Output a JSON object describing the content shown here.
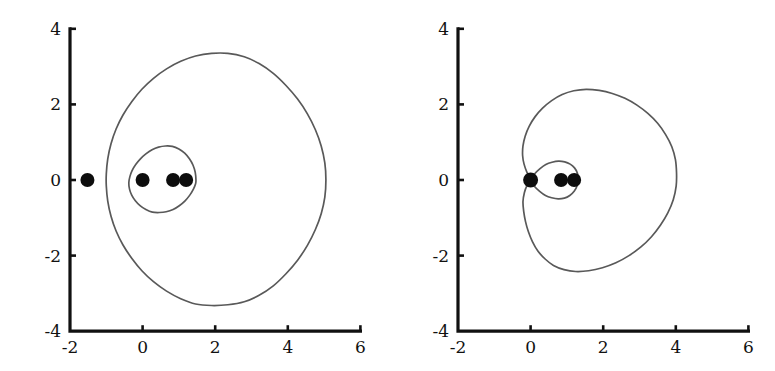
{
  "figure": {
    "background_color": "#ffffff",
    "curve_color": "#595959",
    "axis_color": "#111111",
    "marker_color": "#0d0d0d",
    "panel_count": 2
  },
  "chart_data": [
    {
      "type": "line",
      "panel": "left",
      "title": "",
      "subtitle": "",
      "xlabel": "",
      "ylabel": "",
      "xlim": [
        -2,
        6
      ],
      "ylim": [
        -4,
        4
      ],
      "xticks": [
        -2,
        0,
        2,
        4,
        6
      ],
      "xtick_labels": [
        "-2",
        "0",
        "2",
        "4",
        "6"
      ],
      "yticks": [
        -4,
        -2,
        0,
        2,
        4
      ],
      "ytick_labels": [
        "-4",
        "-2",
        "0",
        "2",
        "4"
      ],
      "grid": false,
      "legend": "none",
      "annotations": [],
      "series": [
        {
          "name": "outer-level-curve",
          "closed": true,
          "comment": "large oval lemniscate level set",
          "x_extent": [
            -1.0,
            5.05
          ],
          "y_extent": [
            -3.3,
            3.35
          ],
          "points_xy": [
            [
              5.05,
              0.0
            ],
            [
              5.02,
              0.45
            ],
            [
              4.92,
              0.9
            ],
            [
              4.76,
              1.33
            ],
            [
              4.54,
              1.75
            ],
            [
              4.27,
              2.14
            ],
            [
              3.95,
              2.5
            ],
            [
              3.6,
              2.82
            ],
            [
              3.21,
              3.08
            ],
            [
              2.8,
              3.26
            ],
            [
              2.35,
              3.35
            ],
            [
              1.9,
              3.35
            ],
            [
              1.46,
              3.28
            ],
            [
              1.05,
              3.14
            ],
            [
              0.66,
              2.94
            ],
            [
              0.3,
              2.69
            ],
            [
              -0.02,
              2.4
            ],
            [
              -0.3,
              2.07
            ],
            [
              -0.54,
              1.72
            ],
            [
              -0.73,
              1.35
            ],
            [
              -0.87,
              0.96
            ],
            [
              -0.96,
              0.56
            ],
            [
              -1.0,
              0.16
            ],
            [
              -1.0,
              -0.16
            ],
            [
              -0.96,
              -0.56
            ],
            [
              -0.87,
              -0.96
            ],
            [
              -0.73,
              -1.35
            ],
            [
              -0.54,
              -1.72
            ],
            [
              -0.3,
              -2.07
            ],
            [
              -0.02,
              -2.4
            ],
            [
              0.3,
              -2.69
            ],
            [
              0.66,
              -2.94
            ],
            [
              1.05,
              -3.14
            ],
            [
              1.46,
              -3.28
            ],
            [
              1.9,
              -3.32
            ],
            [
              2.35,
              -3.3
            ],
            [
              2.8,
              -3.22
            ],
            [
              3.21,
              -3.05
            ],
            [
              3.6,
              -2.8
            ],
            [
              3.95,
              -2.48
            ],
            [
              4.27,
              -2.12
            ],
            [
              4.54,
              -1.73
            ],
            [
              4.76,
              -1.31
            ],
            [
              4.92,
              -0.89
            ],
            [
              5.02,
              -0.45
            ],
            [
              5.05,
              0.0
            ]
          ]
        },
        {
          "name": "inner-level-curve",
          "closed": true,
          "comment": "small oval around the three roots",
          "x_extent": [
            -0.38,
            1.47
          ],
          "y_extent": [
            -0.86,
            0.9
          ],
          "points_xy": [
            [
              1.47,
              0.0
            ],
            [
              1.45,
              0.2
            ],
            [
              1.39,
              0.39
            ],
            [
              1.29,
              0.56
            ],
            [
              1.16,
              0.71
            ],
            [
              1.0,
              0.82
            ],
            [
              0.82,
              0.89
            ],
            [
              0.63,
              0.9
            ],
            [
              0.44,
              0.87
            ],
            [
              0.26,
              0.8
            ],
            [
              0.09,
              0.69
            ],
            [
              -0.06,
              0.56
            ],
            [
              -0.19,
              0.41
            ],
            [
              -0.29,
              0.25
            ],
            [
              -0.35,
              0.09
            ],
            [
              -0.38,
              -0.07
            ],
            [
              -0.36,
              -0.24
            ],
            [
              -0.3,
              -0.4
            ],
            [
              -0.2,
              -0.55
            ],
            [
              -0.07,
              -0.68
            ],
            [
              0.09,
              -0.78
            ],
            [
              0.27,
              -0.85
            ],
            [
              0.46,
              -0.86
            ],
            [
              0.65,
              -0.84
            ],
            [
              0.84,
              -0.78
            ],
            [
              1.01,
              -0.68
            ],
            [
              1.17,
              -0.55
            ],
            [
              1.3,
              -0.4
            ],
            [
              1.4,
              -0.24
            ],
            [
              1.46,
              -0.1
            ],
            [
              1.47,
              0.0
            ]
          ]
        }
      ],
      "markers": [
        {
          "name": "marker-dot-a",
          "x": -1.52,
          "y": 0.0,
          "r_px": 7.0
        },
        {
          "name": "marker-dot-b",
          "x": 0.0,
          "y": 0.0,
          "r_px": 7.0
        },
        {
          "name": "marker-dot-c",
          "x": 0.84,
          "y": 0.0,
          "r_px": 7.0
        },
        {
          "name": "marker-dot-d",
          "x": 1.2,
          "y": 0.0,
          "r_px": 7.0
        }
      ]
    },
    {
      "type": "line",
      "panel": "right",
      "title": "",
      "subtitle": "",
      "xlabel": "",
      "ylabel": "",
      "xlim": [
        -2,
        6
      ],
      "ylim": [
        -4,
        4
      ],
      "xticks": [
        -2,
        0,
        2,
        4,
        6
      ],
      "xtick_labels": [
        "-2",
        "0",
        "2",
        "4",
        "6"
      ],
      "yticks": [
        -4,
        -2,
        0,
        2,
        4
      ],
      "ytick_labels": [
        "-4",
        "-2",
        "0",
        "2",
        "4"
      ],
      "grid": false,
      "legend": "none",
      "annotations": [],
      "series": [
        {
          "name": "outer-lemniscate-lobe",
          "closed": true,
          "comment": "large lobe of the figure-eight level curve, pinched at the origin",
          "x_extent": [
            -0.22,
            4.02
          ],
          "y_extent": [
            -2.42,
            2.4
          ],
          "points_xy": [
            [
              0.0,
              0.0
            ],
            [
              -0.1,
              0.2
            ],
            [
              -0.18,
              0.42
            ],
            [
              -0.22,
              0.65
            ],
            [
              -0.21,
              0.9
            ],
            [
              -0.15,
              1.16
            ],
            [
              -0.04,
              1.42
            ],
            [
              0.12,
              1.67
            ],
            [
              0.33,
              1.9
            ],
            [
              0.58,
              2.1
            ],
            [
              0.87,
              2.26
            ],
            [
              1.19,
              2.36
            ],
            [
              1.53,
              2.4
            ],
            [
              1.89,
              2.37
            ],
            [
              2.25,
              2.29
            ],
            [
              2.6,
              2.16
            ],
            [
              2.93,
              1.98
            ],
            [
              3.23,
              1.76
            ],
            [
              3.5,
              1.5
            ],
            [
              3.72,
              1.2
            ],
            [
              3.89,
              0.88
            ],
            [
              3.99,
              0.54
            ],
            [
              4.02,
              0.19
            ],
            [
              4.01,
              -0.16
            ],
            [
              3.93,
              -0.52
            ],
            [
              3.78,
              -0.87
            ],
            [
              3.58,
              -1.19
            ],
            [
              3.33,
              -1.5
            ],
            [
              3.04,
              -1.77
            ],
            [
              2.71,
              -2.0
            ],
            [
              2.35,
              -2.19
            ],
            [
              1.98,
              -2.32
            ],
            [
              1.6,
              -2.4
            ],
            [
              1.24,
              -2.42
            ],
            [
              0.92,
              -2.37
            ],
            [
              0.63,
              -2.26
            ],
            [
              0.4,
              -2.09
            ],
            [
              0.2,
              -1.88
            ],
            [
              0.05,
              -1.63
            ],
            [
              -0.06,
              -1.37
            ],
            [
              -0.14,
              -1.1
            ],
            [
              -0.19,
              -0.83
            ],
            [
              -0.21,
              -0.57
            ],
            [
              -0.17,
              -0.33
            ],
            [
              -0.1,
              -0.15
            ],
            [
              0.0,
              0.0
            ]
          ]
        },
        {
          "name": "inner-lemniscate-lobe",
          "closed": true,
          "comment": "small lobe of the figure-eight, from origin to about x = 1.3",
          "x_extent": [
            0.0,
            1.31
          ],
          "y_extent": [
            -0.5,
            0.5
          ],
          "points_xy": [
            [
              0.0,
              0.0
            ],
            [
              0.12,
              0.17
            ],
            [
              0.26,
              0.3
            ],
            [
              0.42,
              0.41
            ],
            [
              0.59,
              0.47
            ],
            [
              0.77,
              0.5
            ],
            [
              0.94,
              0.48
            ],
            [
              1.09,
              0.42
            ],
            [
              1.21,
              0.32
            ],
            [
              1.29,
              0.18
            ],
            [
              1.31,
              0.02
            ],
            [
              1.28,
              -0.15
            ],
            [
              1.2,
              -0.3
            ],
            [
              1.08,
              -0.41
            ],
            [
              0.93,
              -0.48
            ],
            [
              0.76,
              -0.5
            ],
            [
              0.58,
              -0.47
            ],
            [
              0.41,
              -0.41
            ],
            [
              0.25,
              -0.3
            ],
            [
              0.11,
              -0.17
            ],
            [
              0.0,
              0.0
            ]
          ]
        }
      ],
      "markers": [
        {
          "name": "marker-dot-a",
          "x": 0.0,
          "y": 0.0,
          "r_px": 7.5
        },
        {
          "name": "marker-dot-b",
          "x": 0.84,
          "y": 0.0,
          "r_px": 7.0
        },
        {
          "name": "marker-dot-c",
          "x": 1.2,
          "y": 0.0,
          "r_px": 7.0
        }
      ]
    }
  ]
}
